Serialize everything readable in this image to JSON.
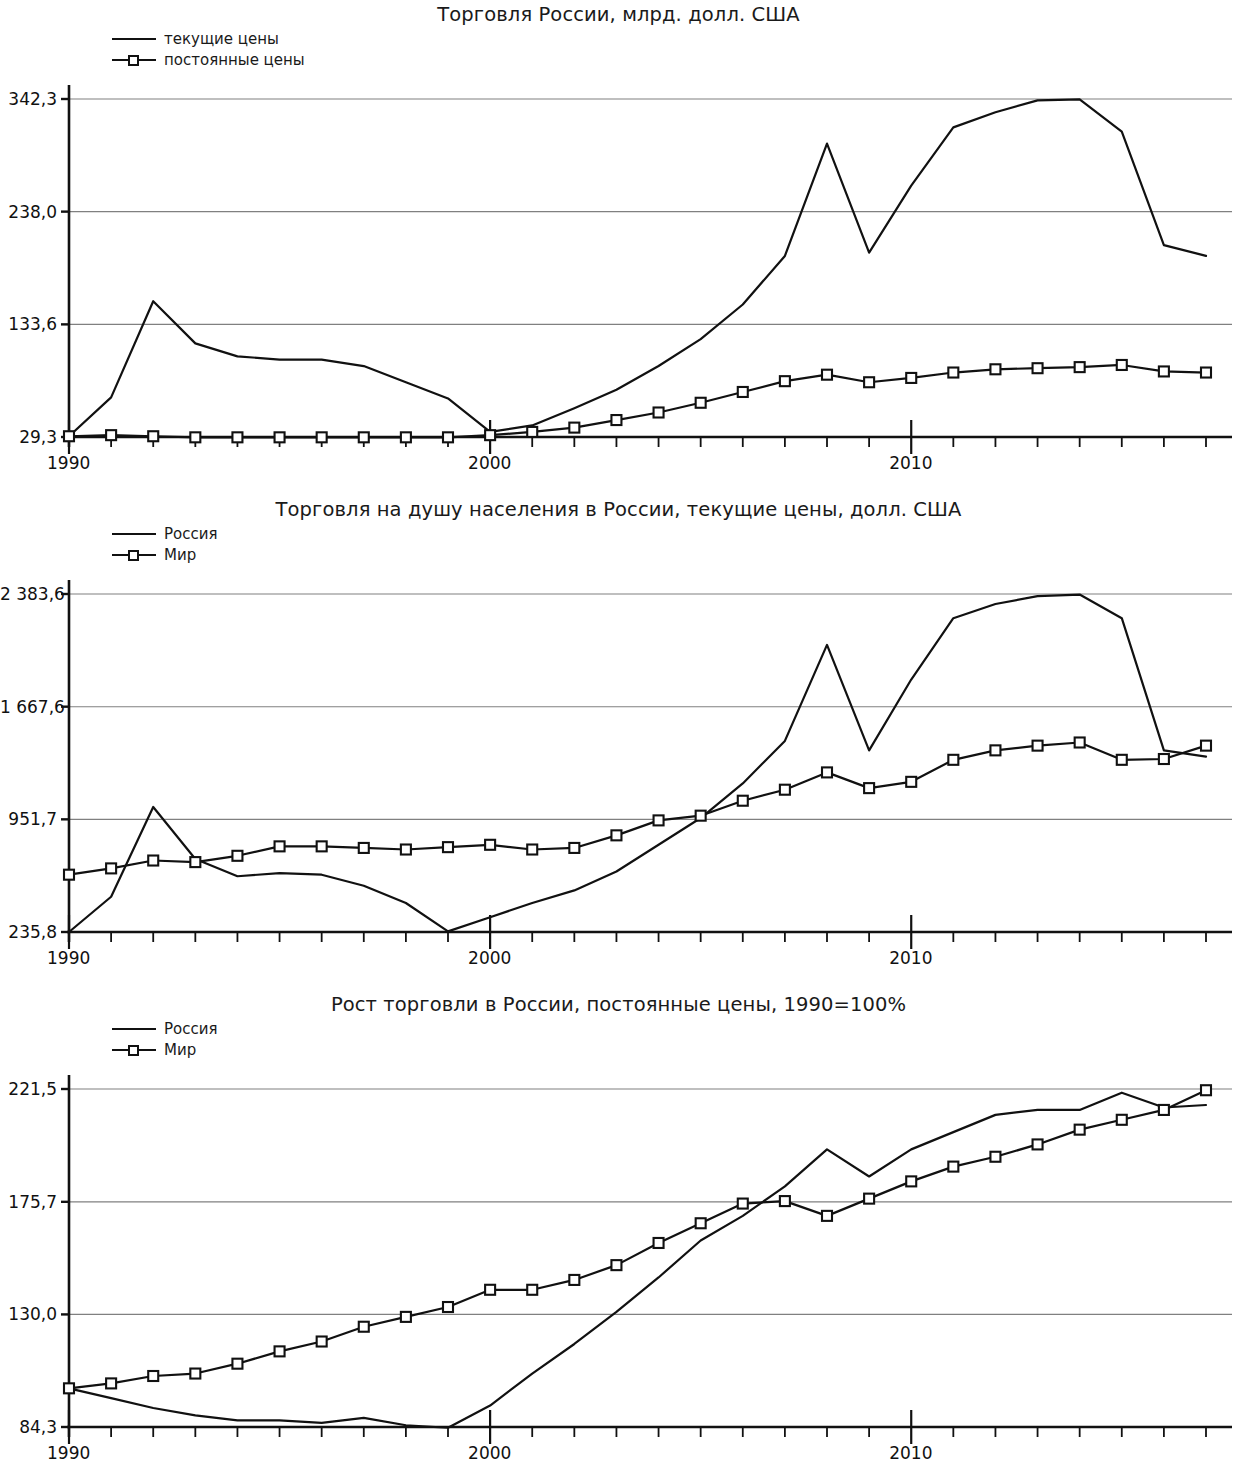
{
  "page": {
    "background": "#ffffff",
    "ink": "#111111",
    "gridline_color": "#808080"
  },
  "charts": [
    {
      "id": "chart-trade-russia-billions",
      "title": "Торговля России, млрд. долл. США",
      "legend": [
        {
          "label": "текущие цены",
          "marker": "line"
        },
        {
          "label": "постоянные цены",
          "marker": "line-square"
        }
      ],
      "y_ticks": [
        "342,3",
        "238,0",
        "133,6",
        "29,3"
      ],
      "y_tick_values": [
        342.3,
        238.0,
        133.6,
        29.3
      ],
      "x_ticks": [
        "1990",
        "2000",
        "2010"
      ],
      "x_tick_values": [
        1990,
        2000,
        2010
      ]
    },
    {
      "id": "chart-trade-per-capita",
      "title": "Торговля на душу населения в России, текущие цены, долл. США",
      "legend": [
        {
          "label": "Россия",
          "marker": "line"
        },
        {
          "label": "Мир",
          "marker": "line-square"
        }
      ],
      "y_ticks": [
        "2 383,6",
        "1 667,6",
        "951,7",
        "235,8"
      ],
      "y_tick_values": [
        2383.6,
        1667.6,
        951.7,
        235.8
      ],
      "x_ticks": [
        "1990",
        "2000",
        "2010"
      ],
      "x_tick_values": [
        1990,
        2000,
        2010
      ]
    },
    {
      "id": "chart-trade-growth",
      "title": "Рост торговли в России, постоянные цены, 1990=100%",
      "legend": [
        {
          "label": "Россия",
          "marker": "line"
        },
        {
          "label": "Мир",
          "marker": "line-square"
        }
      ],
      "y_ticks": [
        "221,5",
        "175,7",
        "130,0",
        "84,3"
      ],
      "y_tick_values": [
        221.5,
        175.7,
        130.0,
        84.3
      ],
      "x_ticks": [
        "1990",
        "2000",
        "2010"
      ],
      "x_tick_values": [
        1990,
        2000,
        2010
      ]
    }
  ],
  "chart_data": [
    {
      "type": "line",
      "title": "Торговля России, млрд. долл. США",
      "xlabel": "",
      "ylabel": "",
      "grid": true,
      "legend_position": "top-left",
      "x": [
        1990,
        1991,
        1992,
        1993,
        1994,
        1995,
        1996,
        1997,
        1998,
        1999,
        2000,
        2001,
        2002,
        2003,
        2004,
        2005,
        2006,
        2007,
        2008,
        2009,
        2010,
        2011,
        2012,
        2013,
        2014,
        2015,
        2016,
        2017
      ],
      "xlim": [
        1990,
        2017
      ],
      "ylim": [
        29.3,
        342.3
      ],
      "series": [
        {
          "name": "текущие цены",
          "marker": "none",
          "values": [
            30,
            66,
            155,
            116,
            104,
            101,
            101,
            95,
            80,
            65,
            34,
            40,
            56,
            73,
            95,
            120,
            152,
            197,
            301,
            200,
            262,
            316,
            330,
            341,
            342,
            312,
            207,
            197,
            239
          ]
        },
        {
          "name": "постоянные цены",
          "marker": "square",
          "values": [
            30,
            31,
            30,
            29,
            29,
            29,
            29,
            29,
            29,
            29,
            31,
            34,
            38,
            45,
            52,
            61,
            71,
            81,
            87,
            80,
            84,
            89,
            92,
            93,
            94,
            96,
            90,
            89,
            91
          ]
        }
      ]
    },
    {
      "type": "line",
      "title": "Торговля на душу населения в России, текущие цены, долл. США",
      "xlabel": "",
      "ylabel": "",
      "grid": true,
      "legend_position": "top-left",
      "x": [
        1990,
        1991,
        1992,
        1993,
        1994,
        1995,
        1996,
        1997,
        1998,
        1999,
        2000,
        2001,
        2002,
        2003,
        2004,
        2005,
        2006,
        2007,
        2008,
        2009,
        2010,
        2011,
        2012,
        2013,
        2014,
        2015,
        2016,
        2017
      ],
      "xlim": [
        1990,
        2017
      ],
      "ylim": [
        235.8,
        2383.6
      ],
      "series": [
        {
          "name": "Россия",
          "marker": "none",
          "values": [
            236,
            460,
            1030,
            700,
            590,
            610,
            600,
            530,
            420,
            240,
            330,
            420,
            500,
            620,
            790,
            960,
            1180,
            1450,
            2060,
            1390,
            1840,
            2230,
            2320,
            2370,
            2380,
            2230,
            1390,
            1350,
            1665
          ]
        },
        {
          "name": "Мир",
          "marker": "square",
          "values": [
            600,
            640,
            690,
            680,
            720,
            780,
            780,
            770,
            760,
            775,
            790,
            760,
            770,
            850,
            945,
            975,
            1070,
            1140,
            1250,
            1150,
            1190,
            1330,
            1390,
            1420,
            1440,
            1330,
            1335,
            1420
          ]
        }
      ]
    },
    {
      "type": "line",
      "title": "Рост торговли в России, постоянные цены, 1990=100%",
      "xlabel": "",
      "ylabel": "",
      "grid": true,
      "legend_position": "top-left",
      "x": [
        1990,
        1991,
        1992,
        1993,
        1994,
        1995,
        1996,
        1997,
        1998,
        1999,
        2000,
        2001,
        2002,
        2003,
        2004,
        2005,
        2006,
        2007,
        2008,
        2009,
        2010,
        2011,
        2012,
        2013,
        2014,
        2015,
        2016,
        2017
      ],
      "xlim": [
        1990,
        2017
      ],
      "ylim": [
        84.3,
        221.5
      ],
      "series": [
        {
          "name": "Россия",
          "marker": "none",
          "values": [
            100,
            96,
            92,
            89,
            87,
            87,
            86,
            88,
            85,
            84,
            93,
            106,
            118,
            131,
            145,
            160,
            170,
            182,
            197,
            186,
            197,
            204,
            211,
            213,
            213,
            220,
            214,
            215,
            219
          ]
        },
        {
          "name": "Мир",
          "marker": "square",
          "values": [
            100,
            102,
            105,
            106,
            110,
            115,
            119,
            125,
            129,
            133,
            140,
            140,
            144,
            150,
            159,
            167,
            175,
            176,
            170,
            177,
            184,
            190,
            194,
            199,
            205,
            209,
            213,
            221
          ]
        }
      ]
    }
  ]
}
